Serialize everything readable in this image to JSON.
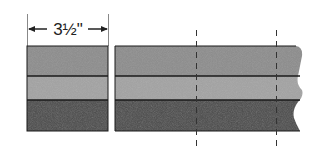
{
  "diagram": {
    "dimension_label": "3½\"",
    "layers": [
      {
        "name": "top-layer",
        "color": "#8c8c8c"
      },
      {
        "name": "middle-layer",
        "color": "#a3a3a3"
      },
      {
        "name": "bottom-layer",
        "color": "#4a4a4a"
      }
    ],
    "cut_lines": 2
  }
}
